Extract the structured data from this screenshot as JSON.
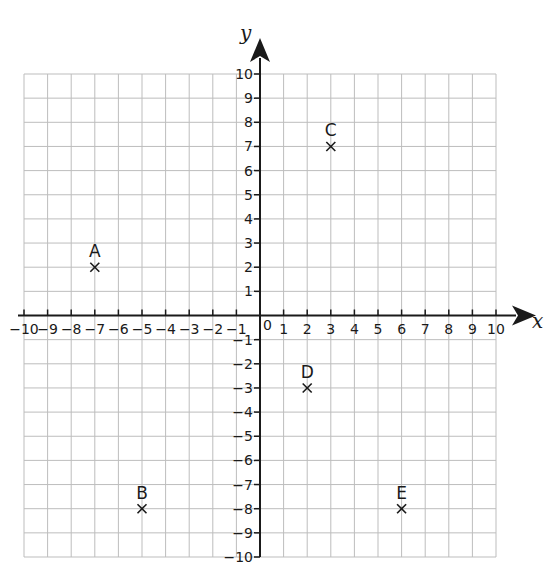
{
  "diagram": {
    "type": "coordinate-grid",
    "x_axis": {
      "label": "x",
      "min": -10,
      "max": 10,
      "step": 1
    },
    "y_axis": {
      "label": "y",
      "min": -10,
      "max": 10,
      "step": 1
    },
    "origin_label": "0",
    "points": [
      {
        "label": "A",
        "x": -7,
        "y": 2
      },
      {
        "label": "B",
        "x": -5,
        "y": -8
      },
      {
        "label": "C",
        "x": 3,
        "y": 7
      },
      {
        "label": "D",
        "x": 2,
        "y": -3
      },
      {
        "label": "E",
        "x": 6,
        "y": -8
      }
    ],
    "marker": "cross",
    "colors": {
      "grid": "#bdbdbd",
      "axis": "#1a1a1a",
      "text": "#1a1a1a",
      "background": "#ffffff"
    }
  }
}
